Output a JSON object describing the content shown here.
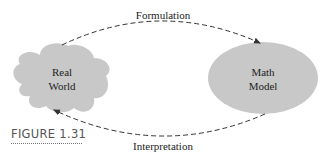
{
  "figure": {
    "caption": "FIGURE 1.31"
  },
  "nodes": {
    "real_world": {
      "line1": "Real",
      "line2": "World",
      "fill": "#c8c8c8"
    },
    "math_model": {
      "line1": "Math",
      "line2": "Model",
      "fill": "#c8c8c8"
    }
  },
  "edges": {
    "formulation": {
      "label": "Formulation"
    },
    "interpretation": {
      "label": "Interpretation"
    }
  }
}
